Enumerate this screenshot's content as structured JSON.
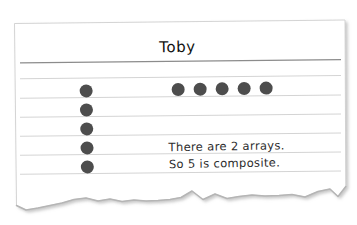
{
  "worksheet": {
    "student_name": "Toby",
    "paper_color": "#ffffff",
    "name_rule_color": "#8c8c8c",
    "rule_color": "#d0d0d0",
    "dot_color": "#4d4d4d",
    "ink_color": "#2c2c2c",
    "torn_edge_color": "#b5b5b5"
  },
  "arrays": {
    "column_array": {
      "label": "vertical-array-5-dots",
      "count": 5,
      "rows": 5,
      "cols": 1,
      "dots": [
        {
          "x": 86,
          "y": 85
        },
        {
          "x": 86,
          "y": 105
        },
        {
          "x": 86,
          "y": 124
        },
        {
          "x": 86,
          "y": 144
        },
        {
          "x": 86,
          "y": 162
        }
      ]
    },
    "row_array": {
      "label": "horizontal-array-5-dots",
      "count": 5,
      "rows": 1,
      "cols": 5,
      "dots": [
        {
          "x": 172,
          "y": 85
        },
        {
          "x": 194,
          "y": 85
        },
        {
          "x": 216,
          "y": 85
        },
        {
          "x": 238,
          "y": 85
        },
        {
          "x": 260,
          "y": 85
        }
      ]
    }
  },
  "answer": {
    "line_1": "There are 2 arrays.",
    "line_2": "So 5 is composite.",
    "array_count": 2,
    "number": 5,
    "classification": "composite"
  },
  "ruled_lines": [
    {
      "name": "name-rule",
      "y": 62,
      "weight": "heavy"
    },
    {
      "name": "rule-1",
      "y": 78,
      "weight": "light"
    },
    {
      "name": "rule-2",
      "y": 98,
      "weight": "light"
    },
    {
      "name": "rule-3",
      "y": 117,
      "weight": "light"
    },
    {
      "name": "rule-4",
      "y": 136,
      "weight": "light"
    },
    {
      "name": "rule-5",
      "y": 155,
      "weight": "light"
    },
    {
      "name": "rule-6",
      "y": 174,
      "weight": "light"
    }
  ]
}
